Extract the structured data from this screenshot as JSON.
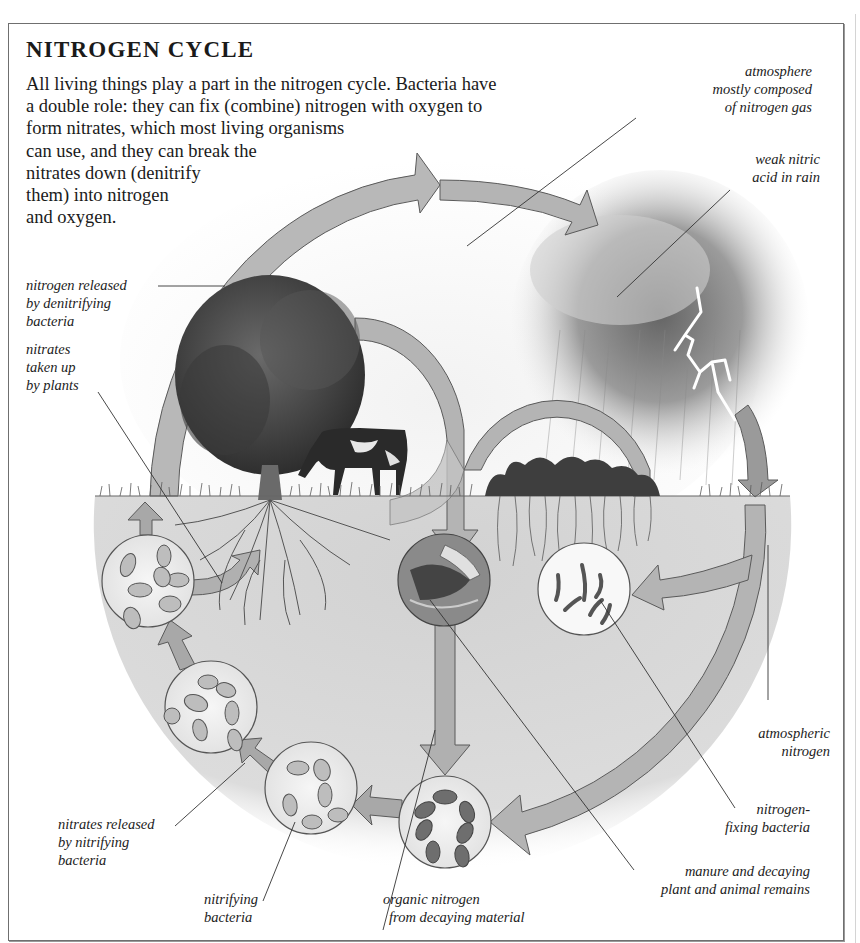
{
  "title": "NITROGEN CYCLE",
  "intro_lines": [
    "All living things play a part in the nitrogen cycle. Bacteria have",
    "a double role: they can fix (combine) nitrogen with oxygen to",
    "form nitrates, which most living organisms",
    "can use, and they can break the",
    "nitrates down (denitrify",
    "them) into nitrogen",
    "and oxygen."
  ],
  "labels": {
    "atmosphere": [
      "atmosphere",
      "mostly composed",
      "of nitrogen gas"
    ],
    "nitric_acid": [
      "weak nitric",
      "acid in rain"
    ],
    "nitrogen_released": [
      "nitrogen released",
      "by denitrifying",
      "bacteria"
    ],
    "nitrates_taken_up": [
      "nitrates",
      "taken up",
      "by plants"
    ],
    "atmospheric_nitrogen": [
      "atmospheric",
      "nitrogen"
    ],
    "nitrogen_fixing": [
      "nitrogen-",
      "fixing bacteria"
    ],
    "nitrates_released": [
      "nitrates released",
      "by nitrifying",
      "bacteria"
    ],
    "nitrifying_bacteria": [
      "nitrifying",
      "bacteria"
    ],
    "organic_nitrogen": [
      "organic nitrogen",
      "from decaying material"
    ],
    "manure": [
      "manure and decaying",
      "plant and animal remains"
    ]
  },
  "colors": {
    "arrow_fill": "#b4b4b4",
    "arrow_stroke": "#5a5a5a",
    "soil": "#d9d9d9",
    "sky": "#efefef",
    "frame": "#6f6f6f"
  },
  "illustration": {
    "elements": [
      "tree",
      "cow",
      "storm-cloud",
      "lightning",
      "grass",
      "roots",
      "bacteria-circles",
      "cycle-arrows"
    ]
  }
}
